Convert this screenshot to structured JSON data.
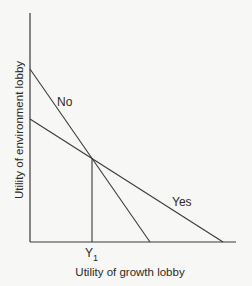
{
  "diagram": {
    "y_axis_label": "Utility of environment lobby",
    "x_axis_label": "Utility of growth lobby",
    "lines": [
      {
        "name": "No",
        "label": "No"
      },
      {
        "name": "Yes",
        "label": "Yes"
      }
    ],
    "intersection_label": "Y",
    "intersection_subscript": "1",
    "colors": {
      "background": "#f7f7f5",
      "line": "#3a3a3a",
      "text": "#2a2a2a"
    }
  }
}
